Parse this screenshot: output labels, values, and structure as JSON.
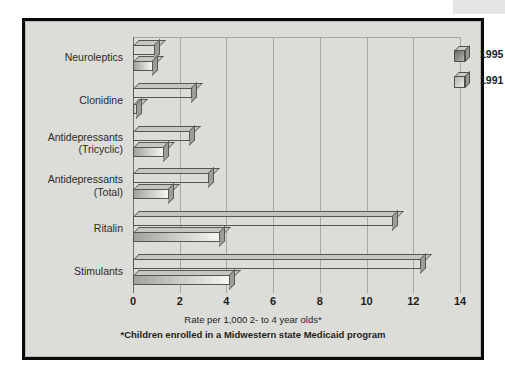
{
  "artifact": {
    "name": "scan-edge-strip"
  },
  "chart_data": {
    "type": "bar",
    "orientation": "horizontal",
    "title": "",
    "xlabel": "Rate per 1,000 2- to 4 year olds*",
    "ylabel": "",
    "footnote": "*Children enrolled in a Midwestern state Medicaid program",
    "xlim": [
      0,
      14
    ],
    "xticks": [
      0,
      2,
      4,
      6,
      8,
      10,
      12,
      14
    ],
    "xtick_labels": [
      "0",
      "2",
      "4",
      "6",
      "8",
      "10",
      "12",
      "14"
    ],
    "grid": true,
    "grid_axis": "x",
    "legend_position": "top-right",
    "categories": [
      "Neuroleptics",
      "Clonidine",
      "Antidepressants\n(Tricyclic)",
      "Antidepressants\n(Total)",
      "Ritalin",
      "Stimulants"
    ],
    "series": [
      {
        "name": "1995",
        "color": "#6f6f6a",
        "values": [
          0.9,
          2.5,
          2.4,
          3.2,
          11.1,
          12.3
        ]
      },
      {
        "name": "1991",
        "color": "#c4c4be",
        "values": [
          0.8,
          0.05,
          1.3,
          1.5,
          3.7,
          4.1
        ]
      }
    ]
  },
  "legend": {
    "entries": [
      {
        "label": "1995",
        "icon": "cube-icon"
      },
      {
        "label": "1991",
        "icon": "cube-icon"
      }
    ]
  }
}
